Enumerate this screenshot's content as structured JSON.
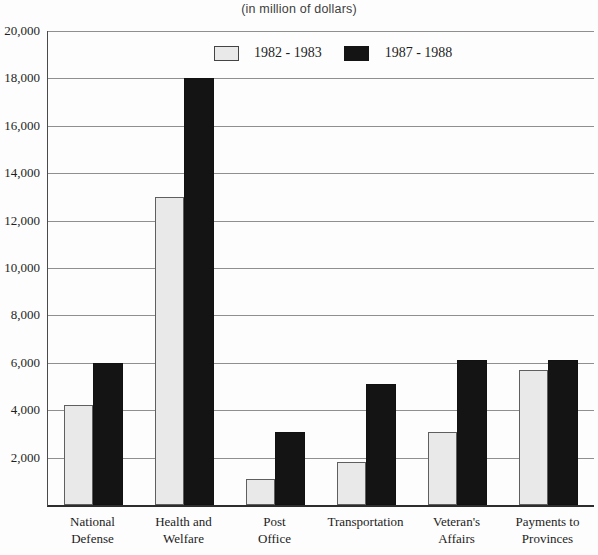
{
  "title": "(in million of dollars)",
  "legend": {
    "series1_label": "1982 - 1983",
    "series2_label": "1987 - 1988"
  },
  "colors": {
    "series1_fill": "#e9e9e9",
    "series1_border": "#5f5f5f",
    "series2_fill": "#141414",
    "gridline": "#8f8f8f",
    "axis": "#2d2d2d",
    "text": "#1f1f1f"
  },
  "chart_data": {
    "type": "bar",
    "title": "(in million of dollars)",
    "categories": [
      "National Defense",
      "Health and Welfare",
      "Post Office",
      "Transportation",
      "Veteran's Affairs",
      "Payments to Provinces"
    ],
    "category_label_lines": [
      [
        "National",
        "Defense"
      ],
      [
        "Health and",
        "Welfare"
      ],
      [
        "Post",
        "Office"
      ],
      [
        "Transportation"
      ],
      [
        "Veteran's",
        "Affairs"
      ],
      [
        "Payments to",
        "Provinces"
      ]
    ],
    "series": [
      {
        "name": "1982 - 1983",
        "values": [
          4200,
          13000,
          1100,
          1800,
          3100,
          5700
        ]
      },
      {
        "name": "1987 - 1988",
        "values": [
          6000,
          18000,
          3100,
          5100,
          6100,
          6100
        ]
      }
    ],
    "xlabel": "",
    "ylabel": "",
    "ylim": [
      0,
      20000
    ],
    "y_tick_step": 2000,
    "y_tick_labels": [
      "2,000",
      "4,000",
      "6,000",
      "8,000",
      "10,000",
      "12,000",
      "14,000",
      "16,000",
      "18,000",
      "20,000"
    ],
    "grid": "horizontal, every 2000",
    "legend_position": "top-inside"
  }
}
